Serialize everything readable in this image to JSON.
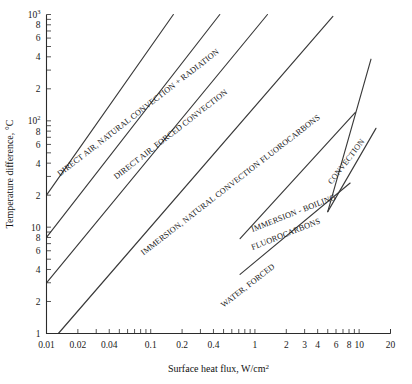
{
  "chart_data": {
    "type": "line",
    "title": "",
    "xlabel": "Surface heat flux, W/cm²",
    "ylabel": "Temperature difference, °C",
    "xscale": "log",
    "yscale": "log",
    "xlim": [
      0.01,
      20
    ],
    "ylim": [
      1,
      1000
    ],
    "grid": false,
    "legend_position": "inline-annotations",
    "x_tick_labels": [
      "0.01",
      "0.02",
      "0.04",
      "0.1",
      "0.2",
      "0.4",
      "1",
      "2",
      "3",
      "4",
      "6",
      "8",
      "10",
      "20"
    ],
    "x_tick_values": [
      0.01,
      0.02,
      0.04,
      0.1,
      0.2,
      0.4,
      1,
      2,
      3,
      4,
      6,
      8,
      10,
      20
    ],
    "y_tick_labels": [
      "1",
      "2",
      "4",
      "6",
      "8",
      "10",
      "2",
      "4",
      "6",
      "8",
      "10²",
      "2",
      "4",
      "6",
      "8",
      "10³"
    ],
    "y_tick_values": [
      1,
      2,
      4,
      6,
      8,
      10,
      20,
      40,
      60,
      80,
      100,
      200,
      400,
      600,
      800,
      1000
    ],
    "series": [
      {
        "name": "DIRECT AIR, NATURAL CONVECTION + RADIATION",
        "x": [
          0.01,
          0.165
        ],
        "y": [
          20,
          1000
        ],
        "label_angle": -37.5,
        "label_x": 0.0145,
        "label_y": 31
      },
      {
        "name": "DIRECT AIR, FORCED CONVECTION",
        "x": [
          0.01,
          0.46
        ],
        "y": [
          8,
          1000
        ],
        "label_angle": -37.5,
        "label_x": 0.047,
        "label_y": 30
      },
      {
        "name": "IMMERSION, NATURAL CONVECTION FLUOROCARBONS",
        "x": [
          0.01,
          1.32
        ],
        "y": [
          3,
          1000
        ],
        "label_angle": -37.5,
        "label_x": 0.088,
        "label_y": 6.4
      },
      {
        "name": "WATER, FORCED",
        "x": [
          0.013,
          5.6
        ],
        "y": [
          1,
          960
        ],
        "label_angle": -37.5,
        "label_x": 0.52,
        "label_y": 2.1
      },
      {
        "name": "IMMERSION - BOILING FLUOROCARBONS upper bound",
        "x": [
          0.72,
          9.2
        ],
        "y": [
          7.8,
          120
        ],
        "label_angle": -22,
        "label_x": 1.05,
        "label_y": 9.3
      },
      {
        "name": "IMMERSION - BOILING FLUOROCARBONS lower bound",
        "x": [
          0.72,
          8.2
        ],
        "y": [
          3.6,
          26
        ],
        "label_angle": -22,
        "label_x": 1.05,
        "label_y": 4.3
      },
      {
        "name": "CONVECTION upper bound",
        "x": [
          5.0,
          13.0
        ],
        "y": [
          14,
          380
        ],
        "label_angle": -52,
        "label_x": 6.2,
        "label_y": 42
      },
      {
        "name": "CONVECTION lower bound",
        "x": [
          5.0,
          14.5
        ],
        "y": [
          14,
          85
        ],
        "label_angle": -52,
        "label_x": 6.2,
        "label_y": 42
      }
    ],
    "annotations": [
      {
        "text": "DIRECT AIR, NATURAL CONVECTION + RADIATION"
      },
      {
        "text": "DIRECT AIR, FORCED CONVECTION"
      },
      {
        "text": "IMMERSION, NATURAL CONVECTION FLUOROCARBONS"
      },
      {
        "text": "IMMERSION - BOILING"
      },
      {
        "text": "FLUOROCARBONS"
      },
      {
        "text": "WATER, FORCED"
      },
      {
        "text": "CONVECTION"
      }
    ]
  },
  "axes": {
    "x_title_main": "Surface heat flux, W/cm",
    "x_title_sup": "2",
    "y_title": "Temperature difference, °C"
  },
  "labels": {
    "direct_air_natural": "DIRECT AIR, NATURAL CONVECTION + RADIATION",
    "direct_air_forced": "DIRECT AIR, FORCED CONVECTION",
    "immersion_natural": "IMMERSION, NATURAL CONVECTION FLUOROCARBONS",
    "immersion_boiling_line1": "IMMERSION - BOILING",
    "immersion_boiling_line2": "FLUOROCARBONS",
    "water_forced": "WATER, FORCED",
    "convection": "CONVECTION"
  },
  "ticks": {
    "x": [
      {
        "label": "0.01",
        "value": 0.01
      },
      {
        "label": "0.02",
        "value": 0.02
      },
      {
        "label": "0.04",
        "value": 0.04
      },
      {
        "label": "0.1",
        "value": 0.1
      },
      {
        "label": "0.2",
        "value": 0.2
      },
      {
        "label": "0.4",
        "value": 0.4
      },
      {
        "label": "1",
        "value": 1
      },
      {
        "label": "2",
        "value": 2
      },
      {
        "label": "3",
        "value": 3
      },
      {
        "label": "4",
        "value": 4
      },
      {
        "label": "6",
        "value": 6
      },
      {
        "label": "8",
        "value": 8
      },
      {
        "label": "10",
        "value": 10
      },
      {
        "label": "20",
        "value": 20
      }
    ],
    "y": [
      {
        "label": "1",
        "value": 1
      },
      {
        "label": "2",
        "value": 2
      },
      {
        "label": "4",
        "value": 4
      },
      {
        "label": "6",
        "value": 6
      },
      {
        "label": "8",
        "value": 8
      },
      {
        "label": "10",
        "value": 10
      },
      {
        "label": "2",
        "value": 20
      },
      {
        "label": "4",
        "value": 40
      },
      {
        "label": "6",
        "value": 60
      },
      {
        "label": "8",
        "value": 80
      },
      {
        "label": "10",
        "sup": "2",
        "value": 100
      },
      {
        "label": "2",
        "value": 200
      },
      {
        "label": "4",
        "value": 400
      },
      {
        "label": "6",
        "value": 600
      },
      {
        "label": "8",
        "value": 800
      },
      {
        "label": "10",
        "sup": "3",
        "value": 1000
      }
    ]
  },
  "colors": {
    "line": "#3a3a3a",
    "axis": "#2b2b2b",
    "text": "#1a1a1a",
    "background": "#ffffff"
  }
}
